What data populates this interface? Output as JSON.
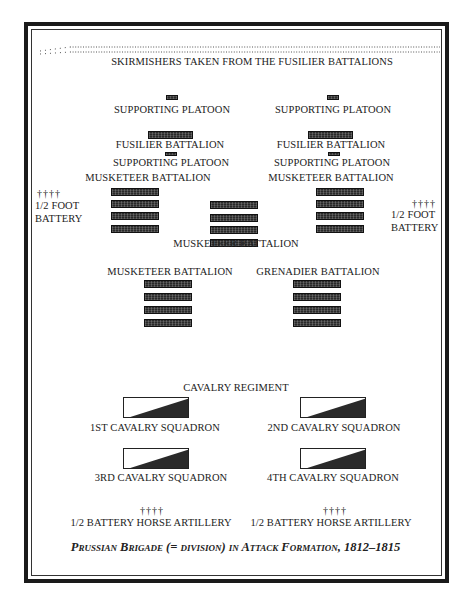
{
  "diagram": {
    "skirmishers": "SKIRMISHERS TAKEN FROM THE FUSILIER BATTALIONS",
    "left_column": {
      "supporting_platoon_1": "SUPPORTING PLATOON",
      "fusilier_battalion": "FUSILIER BATTALION",
      "supporting_platoon_2": "SUPPORTING PLATOON",
      "musketeer_battalion": "MUSKETEER BATTALION"
    },
    "right_column": {
      "supporting_platoon_1": "SUPPORTING PLATOON",
      "fusilier_battalion": "FUSILIER BATTALION",
      "supporting_platoon_2": "SUPPORTING PLATOON",
      "musketeer_battalion": "MUSKETEER BATTALION"
    },
    "center_battalion": "MUSKETEER BATTALION",
    "left_battery": {
      "guns": "††††",
      "line1": "1/2 FOOT",
      "line2": "BATTERY"
    },
    "right_battery": {
      "guns": "††††",
      "line1": "1/2 FOOT",
      "line2": "BATTERY"
    },
    "second_line": {
      "left": "MUSKETEER BATTALION",
      "right": "GRENADIER BATTALION"
    },
    "cavalry": {
      "regiment": "CAVALRY REGIMENT",
      "squadrons": [
        "1ST CAVALRY SQUADRON",
        "2ND CAVALRY SQUADRON",
        "3RD CAVALRY SQUADRON",
        "4TH CAVALRY SQUADRON"
      ]
    },
    "horse_artillery": [
      {
        "guns": "††††",
        "label": "1/2 BATTERY HORSE ARTILLERY"
      },
      {
        "guns": "††††",
        "label": "1/2 BATTERY HORSE ARTILLERY"
      }
    ],
    "caption": "Prussian Brigade (= division) in Attack Formation, 1812–1815"
  },
  "colors": {
    "ink": "#222222",
    "frame": "#1a1a1a",
    "background": "#ffffff"
  }
}
